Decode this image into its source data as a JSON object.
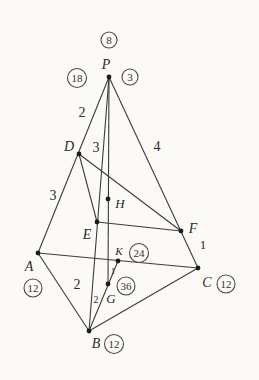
{
  "figure": {
    "name": "tetrahedron-mass-point-diagram",
    "canvas": {
      "width": 259,
      "height": 380,
      "background": "#fbfaf7"
    },
    "style": {
      "line_color": "#3c3c3c",
      "text_color": "#2b2b2b",
      "dot_radius": 2.4
    },
    "points": {
      "P": {
        "x": 109,
        "y": 77
      },
      "D": {
        "x": 79,
        "y": 154
      },
      "A": {
        "x": 38,
        "y": 253
      },
      "B": {
        "x": 89,
        "y": 331
      },
      "C": {
        "x": 198,
        "y": 268
      },
      "F": {
        "x": 181,
        "y": 231
      },
      "E": {
        "x": 97,
        "y": 222
      },
      "H": {
        "x": 108,
        "y": 199
      },
      "K": {
        "x": 118,
        "y": 261
      },
      "G": {
        "x": 108,
        "y": 284
      }
    },
    "edges": [
      {
        "from": "P",
        "to": "A",
        "name": "edge-PA"
      },
      {
        "from": "P",
        "to": "B",
        "name": "edge-PB"
      },
      {
        "from": "P",
        "to": "C",
        "name": "edge-PC"
      },
      {
        "from": "A",
        "to": "B",
        "name": "edge-AB"
      },
      {
        "from": "B",
        "to": "C",
        "name": "edge-BC"
      },
      {
        "from": "A",
        "to": "C",
        "name": "edge-AC"
      },
      {
        "from": "P",
        "to": "G",
        "name": "cevian-PG"
      },
      {
        "from": "D",
        "to": "E",
        "name": "section-DE"
      },
      {
        "from": "D",
        "to": "F",
        "name": "section-DF"
      },
      {
        "from": "E",
        "to": "F",
        "name": "section-EF"
      },
      {
        "from": "B",
        "to": "K",
        "name": "median-BK"
      }
    ],
    "vertex_labels": [
      {
        "text": "P",
        "x": 106,
        "y": 69,
        "size": 14
      },
      {
        "text": "D",
        "x": 69,
        "y": 151,
        "size": 14
      },
      {
        "text": "H",
        "x": 120,
        "y": 208,
        "size": 13
      },
      {
        "text": "E",
        "x": 87,
        "y": 239,
        "size": 14
      },
      {
        "text": "F",
        "x": 193,
        "y": 233,
        "size": 14
      },
      {
        "text": "A",
        "x": 29,
        "y": 271,
        "size": 14
      },
      {
        "text": "K",
        "x": 119,
        "y": 255,
        "size": 11
      },
      {
        "text": "C",
        "x": 207,
        "y": 287,
        "size": 14
      },
      {
        "text": "G",
        "x": 111,
        "y": 303,
        "size": 13
      },
      {
        "text": "B",
        "x": 96,
        "y": 348,
        "size": 14
      }
    ],
    "edge_labels": [
      {
        "text": "2",
        "x": 82,
        "y": 117,
        "size": 14,
        "segment": "PD"
      },
      {
        "text": "3",
        "x": 96,
        "y": 152,
        "size": 14,
        "segment": "PE"
      },
      {
        "text": "4",
        "x": 157,
        "y": 151,
        "size": 14,
        "segment": "PF"
      },
      {
        "text": "3",
        "x": 53,
        "y": 200,
        "size": 14,
        "segment": "DA"
      },
      {
        "text": "1",
        "x": 203,
        "y": 249,
        "size": 13,
        "segment": "FC"
      },
      {
        "text": "2",
        "x": 77,
        "y": 289,
        "size": 14,
        "segment": "EB"
      },
      {
        "text": "1",
        "x": 113,
        "y": 274,
        "size": 9,
        "segment": "GK"
      },
      {
        "text": "2",
        "x": 96,
        "y": 303,
        "size": 10,
        "segment": "GB"
      }
    ],
    "circled_numbers": [
      {
        "value": "8",
        "cx": 109,
        "cy": 40,
        "r": 8,
        "size": 11,
        "near": "P-top"
      },
      {
        "value": "18",
        "cx": 77,
        "cy": 78,
        "r": 9.5,
        "size": 11,
        "near": "P-left"
      },
      {
        "value": "3",
        "cx": 130,
        "cy": 77,
        "r": 8,
        "size": 11,
        "near": "P-right"
      },
      {
        "value": "24",
        "cx": 139,
        "cy": 253,
        "r": 9.5,
        "size": 11,
        "near": "K"
      },
      {
        "value": "36",
        "cx": 126,
        "cy": 286,
        "r": 9,
        "size": 11,
        "near": "G"
      },
      {
        "value": "12",
        "cx": 33,
        "cy": 288,
        "r": 9,
        "size": 11,
        "near": "A"
      },
      {
        "value": "12",
        "cx": 226,
        "cy": 284,
        "r": 9,
        "size": 11,
        "near": "C"
      },
      {
        "value": "12",
        "cx": 114,
        "cy": 344,
        "r": 9.5,
        "size": 11,
        "near": "B"
      }
    ]
  }
}
